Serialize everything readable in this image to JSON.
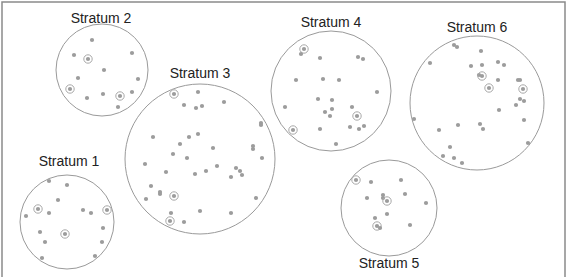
{
  "diagram": {
    "title": "",
    "colors": {
      "frame": "#8a8a8a",
      "circle": "#9a9a9a",
      "dot": "#9c9c9c",
      "selected_ring": "#a8a8a8",
      "label": "#222222"
    },
    "strata": [
      {
        "label": "Stratum 1",
        "label_pos": [
          69,
          166
        ],
        "center": [
          67,
          222
        ],
        "r": 47,
        "units": [
          [
            49,
            181
          ],
          [
            67,
            185
          ],
          [
            58,
            200
          ],
          [
            38,
            209,
            1
          ],
          [
            49,
            213
          ],
          [
            26,
            216
          ],
          [
            83,
            210
          ],
          [
            91,
            213
          ],
          [
            107,
            210,
            1
          ],
          [
            40,
            232
          ],
          [
            65,
            234,
            1
          ],
          [
            103,
            228
          ],
          [
            45,
            242
          ],
          [
            102,
            242
          ],
          [
            42,
            258
          ],
          [
            95,
            256
          ]
        ]
      },
      {
        "label": "Stratum 2",
        "label_pos": [
          101,
          23
        ],
        "center": [
          102,
          70
        ],
        "r": 46,
        "units": [
          [
            92,
            40
          ],
          [
            74,
            55
          ],
          [
            88,
            59,
            1
          ],
          [
            132,
            53
          ],
          [
            104,
            70
          ],
          [
            78,
            78
          ],
          [
            138,
            79
          ],
          [
            70,
            89,
            1
          ],
          [
            87,
            98
          ],
          [
            103,
            94
          ],
          [
            120,
            96,
            1
          ],
          [
            132,
            92
          ],
          [
            118,
            107
          ]
        ]
      },
      {
        "label": "Stratum 3",
        "label_pos": [
          200,
          78
        ],
        "center": [
          200,
          159
        ],
        "r": 75,
        "units": [
          [
            174,
            94,
            1
          ],
          [
            198,
            92
          ],
          [
            184,
            105
          ],
          [
            196,
            108
          ],
          [
            202,
            106
          ],
          [
            224,
            102
          ],
          [
            261,
            123
          ],
          [
            261,
            125
          ],
          [
            153,
            137
          ],
          [
            189,
            137
          ],
          [
            198,
            134
          ],
          [
            180,
            144
          ],
          [
            213,
            148
          ],
          [
            253,
            146
          ],
          [
            253,
            149
          ],
          [
            173,
            154
          ],
          [
            187,
            158
          ],
          [
            262,
            158
          ],
          [
            145,
            164
          ],
          [
            217,
            166
          ],
          [
            166,
            172
          ],
          [
            195,
            174
          ],
          [
            206,
            171
          ],
          [
            236,
            168
          ],
          [
            240,
            171
          ],
          [
            242,
            175
          ],
          [
            231,
            177
          ],
          [
            151,
            186
          ],
          [
            160,
            192
          ],
          [
            160,
            194
          ],
          [
            174,
            196,
            1
          ],
          [
            146,
            199
          ],
          [
            256,
            198
          ],
          [
            171,
            213
          ],
          [
            200,
            211
          ],
          [
            231,
            213
          ],
          [
            170,
            221,
            1
          ],
          [
            184,
            222
          ]
        ]
      },
      {
        "label": "Stratum 4",
        "label_pos": [
          331,
          27
        ],
        "center": [
          331,
          91
        ],
        "r": 60,
        "units": [
          [
            304,
            49,
            1
          ],
          [
            301,
            54
          ],
          [
            320,
            58
          ],
          [
            358,
            57
          ],
          [
            363,
            59
          ],
          [
            296,
            80
          ],
          [
            323,
            79
          ],
          [
            339,
            80
          ],
          [
            377,
            92
          ],
          [
            318,
            99
          ],
          [
            332,
            100
          ],
          [
            285,
            107
          ],
          [
            332,
            109
          ],
          [
            325,
            112
          ],
          [
            330,
            116
          ],
          [
            352,
            107
          ],
          [
            357,
            116,
            1
          ],
          [
            293,
            130,
            1
          ],
          [
            320,
            129
          ],
          [
            350,
            127
          ],
          [
            359,
            129
          ],
          [
            364,
            126
          ],
          [
            336,
            144
          ]
        ]
      },
      {
        "label": "Stratum 5",
        "label_pos": [
          389,
          268
        ],
        "center": [
          389,
          208
        ],
        "r": 48,
        "units": [
          [
            356,
            180,
            1
          ],
          [
            371,
            182
          ],
          [
            401,
            180
          ],
          [
            367,
            198
          ],
          [
            383,
            195
          ],
          [
            383,
            198
          ],
          [
            387,
            201,
            1
          ],
          [
            405,
            194
          ],
          [
            426,
            203
          ],
          [
            375,
            218
          ],
          [
            387,
            214
          ],
          [
            377,
            226,
            1
          ],
          [
            380,
            228
          ],
          [
            410,
            225
          ]
        ]
      },
      {
        "label": "Stratum 6",
        "label_pos": [
          477,
          32
        ],
        "center": [
          477,
          103
        ],
        "r": 67,
        "units": [
          [
            454,
            45
          ],
          [
            457,
            47
          ],
          [
            481,
            51
          ],
          [
            430,
            63
          ],
          [
            471,
            66
          ],
          [
            482,
            65
          ],
          [
            498,
            62
          ],
          [
            504,
            65
          ],
          [
            479,
            75
          ],
          [
            482,
            76,
            1
          ],
          [
            498,
            80
          ],
          [
            518,
            80
          ],
          [
            520,
            80
          ],
          [
            489,
            88,
            1
          ],
          [
            523,
            89,
            1
          ],
          [
            520,
            99
          ],
          [
            524,
            101
          ],
          [
            516,
            105
          ],
          [
            499,
            110
          ],
          [
            414,
            119
          ],
          [
            524,
            120
          ],
          [
            458,
            125
          ],
          [
            480,
            124
          ],
          [
            483,
            129
          ],
          [
            439,
            130
          ],
          [
            528,
            143
          ],
          [
            450,
            147
          ],
          [
            443,
            156
          ],
          [
            454,
            158
          ],
          [
            462,
            163
          ]
        ]
      }
    ]
  }
}
